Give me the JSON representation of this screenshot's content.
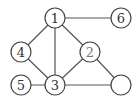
{
  "graph": {
    "nodes": [
      {
        "id": "n1",
        "label": "1",
        "x": 55,
        "y": 18
      },
      {
        "id": "n6",
        "label": "6",
        "x": 121,
        "y": 18
      },
      {
        "id": "n4",
        "label": "4",
        "x": 21,
        "y": 52
      },
      {
        "id": "n2",
        "label": "2",
        "x": 90,
        "y": 52
      },
      {
        "id": "n5",
        "label": "5",
        "x": 21,
        "y": 85
      },
      {
        "id": "n3",
        "label": "3",
        "x": 55,
        "y": 85
      },
      {
        "id": "n7",
        "label": "",
        "x": 121,
        "y": 85
      }
    ],
    "edges": [
      [
        "n1",
        "n6"
      ],
      [
        "n1",
        "n4"
      ],
      [
        "n1",
        "n3"
      ],
      [
        "n1",
        "n2"
      ],
      [
        "n4",
        "n3"
      ],
      [
        "n2",
        "n3"
      ],
      [
        "n2",
        "n7"
      ],
      [
        "n5",
        "n3"
      ],
      [
        "n3",
        "n7"
      ]
    ],
    "node_radius": 10
  }
}
